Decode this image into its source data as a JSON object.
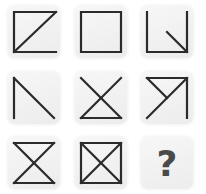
{
  "puzzle": {
    "type": "3x3 figure matrix",
    "cells": [
      {
        "row": 1,
        "col": 1,
        "figure": "open-box-diagonal",
        "description": "top, left, bottom sides with diagonal bottom-left to top-right"
      },
      {
        "row": 1,
        "col": 2,
        "figure": "square",
        "description": "closed square"
      },
      {
        "row": 1,
        "col": 3,
        "figure": "u-shape-with-inner-diagonal",
        "description": "left, bottom, right sides with short diagonal from center to bottom-right"
      },
      {
        "row": 2,
        "col": 1,
        "figure": "left-side-with-diagonal",
        "description": "left side with diagonal top-left to bottom-right"
      },
      {
        "row": 2,
        "col": 2,
        "figure": "x-with-bottom",
        "description": "two diagonals with bottom side"
      },
      {
        "row": 2,
        "col": 3,
        "figure": "top-right-with-diagonals",
        "description": "top and right sides, diagonal bottom-left to top-right, short segment top-left to center"
      },
      {
        "row": 3,
        "col": 1,
        "figure": "hourglass",
        "description": "top and bottom sides with both diagonals"
      },
      {
        "row": 3,
        "col": 2,
        "figure": "square-with-x",
        "description": "closed square with both diagonals"
      },
      {
        "row": 3,
        "col": 3,
        "figure": "question-mark",
        "label": "?"
      }
    ]
  }
}
